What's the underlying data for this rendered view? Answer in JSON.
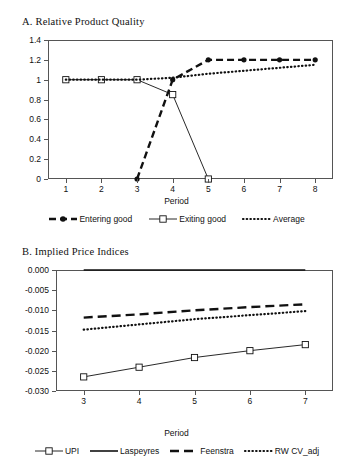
{
  "figure": {
    "panel_a_title": "A.  Relative Product Quality",
    "panel_b_title": "B.  Implied Price Indices"
  },
  "chart_data": [
    {
      "type": "line",
      "title": "A.  Relative Product Quality",
      "xlabel": "Period",
      "ylabel": "",
      "x": [
        1,
        2,
        3,
        4,
        5,
        6,
        7,
        8
      ],
      "xlim": [
        0.5,
        8.5
      ],
      "ylim": [
        0,
        1.4
      ],
      "yticks": [
        "0",
        "0.2",
        "0.4",
        "0.6",
        "0.8",
        "1",
        "1.2",
        "1.4"
      ],
      "ytick_values": [
        0,
        0.2,
        0.4,
        0.6,
        0.8,
        1.0,
        1.2,
        1.4
      ],
      "xticks": [
        "1",
        "2",
        "3",
        "4",
        "5",
        "6",
        "7",
        "8"
      ],
      "grid": false,
      "legend_position": "bottom",
      "series": [
        {
          "name": "Entering good",
          "style": "dashed-thick",
          "marker": "filled-circle",
          "x": [
            3,
            4,
            5,
            6,
            7,
            8
          ],
          "values": [
            0,
            1.0,
            1.2,
            1.2,
            1.2,
            1.2
          ]
        },
        {
          "name": "Exiting good",
          "style": "solid-thin",
          "marker": "open-square",
          "x": [
            1,
            2,
            3,
            4,
            5
          ],
          "values": [
            1.0,
            1.0,
            1.0,
            0.85,
            0
          ]
        },
        {
          "name": "Average",
          "style": "dotted",
          "marker": "none",
          "x": [
            1,
            2,
            3,
            4,
            5,
            6,
            7,
            8
          ],
          "values": [
            1.0,
            1.0,
            1.0,
            1.02,
            1.06,
            1.09,
            1.12,
            1.15
          ]
        }
      ]
    },
    {
      "type": "line",
      "title": "B.  Implied Price Indices",
      "xlabel": "Period",
      "ylabel": "",
      "x": [
        3,
        4,
        5,
        6,
        7
      ],
      "xlim": [
        2.5,
        7.5
      ],
      "ylim": [
        -0.03,
        0.0
      ],
      "yticks": [
        "-0.030",
        "-0.025",
        "-0.020",
        "-0.015",
        "-0.010",
        "-0.005",
        "0.000"
      ],
      "ytick_values": [
        -0.03,
        -0.025,
        -0.02,
        -0.015,
        -0.01,
        -0.005,
        0.0
      ],
      "xticks": [
        "3",
        "4",
        "5",
        "6",
        "7"
      ],
      "grid": false,
      "legend_position": "bottom",
      "series": [
        {
          "name": "UPI",
          "style": "solid-thin",
          "marker": "open-square",
          "values": [
            -0.0265,
            -0.0241,
            -0.0217,
            -0.02,
            -0.0185
          ]
        },
        {
          "name": "Laspeyres",
          "style": "solid-thick",
          "marker": "none",
          "values": [
            0.0,
            0.0,
            0.0,
            0.0,
            0.0
          ]
        },
        {
          "name": "Feenstra",
          "style": "long-dash",
          "marker": "none",
          "values": [
            -0.0118,
            -0.011,
            -0.01,
            -0.0092,
            -0.0085
          ]
        },
        {
          "name": "RW CV_adj",
          "style": "dotted",
          "marker": "none",
          "values": [
            -0.0148,
            -0.0135,
            -0.0122,
            -0.0112,
            -0.0102
          ]
        }
      ]
    }
  ],
  "legend_a": [
    {
      "label": "Entering good",
      "style": "dashed-thick",
      "marker": "filled-circle"
    },
    {
      "label": "Exiting good",
      "style": "solid-thin",
      "marker": "open-square"
    },
    {
      "label": "Average",
      "style": "dotted",
      "marker": "none"
    }
  ],
  "legend_b": [
    {
      "label": "UPI",
      "style": "solid-thin",
      "marker": "open-square"
    },
    {
      "label": "Laspeyres",
      "style": "solid-thick",
      "marker": "none"
    },
    {
      "label": "Feenstra",
      "style": "long-dash",
      "marker": "none"
    },
    {
      "label": "RW CV_adj",
      "style": "dotted",
      "marker": "none"
    }
  ],
  "axis_labels": {
    "period_a": "Period",
    "period_b": "Period"
  }
}
